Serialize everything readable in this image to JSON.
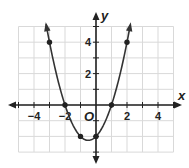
{
  "chart_data": {
    "type": "line",
    "title": "",
    "xlabel": "x",
    "ylabel": "y",
    "origin_label": "O",
    "xlim": [
      -5,
      5
    ],
    "ylim": [
      -3,
      5
    ],
    "grid": true,
    "x_ticks": [
      -4,
      -2,
      2,
      4
    ],
    "x_tick_labels": [
      "−4",
      "−2",
      "2",
      "4"
    ],
    "y_ticks": [
      2,
      4
    ],
    "y_tick_labels": [
      "2",
      "4"
    ],
    "equation": "y = x^2 + x - 2",
    "series": [
      {
        "name": "parabola",
        "points": [
          [
            -3,
            4
          ],
          [
            -2,
            0
          ],
          [
            -1,
            -2
          ],
          [
            0,
            -2
          ],
          [
            1,
            0
          ],
          [
            2,
            4
          ]
        ],
        "vertex": [
          -0.5,
          -2.25
        ]
      }
    ],
    "colors": {
      "grid": "#d9d9d9",
      "axis": "#222222",
      "curve": "#333333"
    }
  }
}
